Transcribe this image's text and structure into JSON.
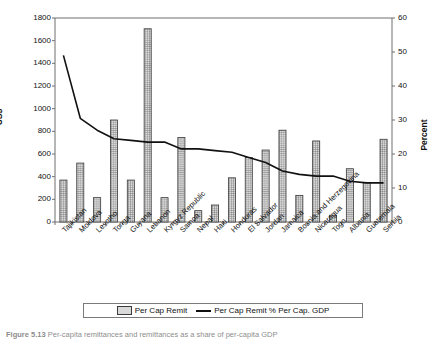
{
  "chart_data": {
    "type": "bar",
    "title": "",
    "subtitle": "",
    "xlabel": "",
    "ylabel": "US$",
    "y2label": "Percent",
    "ylim": [
      0,
      1800
    ],
    "y2lim": [
      0,
      60
    ],
    "yticks": [
      0,
      200,
      400,
      600,
      800,
      1000,
      1200,
      1400,
      1600,
      1800
    ],
    "y2ticks": [
      0,
      10,
      20,
      30,
      40,
      50,
      60
    ],
    "grid": false,
    "legend_position": "bottom",
    "categories": [
      "Tajikistan",
      "Moldova",
      "Lesotho",
      "Tonga",
      "Guyana",
      "Lebanon",
      "Kyrgyz Republic",
      "Samoa",
      "Nepal",
      "Haiti",
      "Honduras",
      "El Salvador",
      "Jordan",
      "Jamaica",
      "Bosnia and Herzegovina",
      "Nicaragua",
      "Togo",
      "Albania",
      "Guatemala",
      "Serbia"
    ],
    "series": [
      {
        "name": "Per Cap Remit",
        "type": "bar",
        "axis": "left",
        "unit": "US$",
        "values": [
          370,
          520,
          215,
          900,
          370,
          1705,
          215,
          745,
          100,
          150,
          390,
          570,
          635,
          810,
          235,
          715,
          60,
          470,
          345,
          730
        ]
      },
      {
        "name": "Per Cap Remit % Per Cap. GDP",
        "type": "line",
        "axis": "right",
        "unit": "Percent",
        "values": [
          49.0,
          30.5,
          27.0,
          24.5,
          24.0,
          23.5,
          23.5,
          21.5,
          21.5,
          21.0,
          20.5,
          19.0,
          17.5,
          15.0,
          14.0,
          13.5,
          13.5,
          12.0,
          11.5,
          11.5
        ]
      }
    ]
  },
  "legend": {
    "items": [
      {
        "label": "Per Cap Remit",
        "marker": "bar-swatch"
      },
      {
        "label": "Per Cap Remit % Per Cap. GDP",
        "marker": "line-swatch"
      }
    ]
  },
  "caption": {
    "figure_number": "Figure 5.13",
    "text": "Per-capita remittances and remittances as a share of per-capita GDP"
  },
  "colors": {
    "line": "#111111",
    "bar_fill": "#d9d9d9",
    "bar_edge": "#3a3a3a",
    "axis": "#6f6f6f",
    "text": "#111111"
  }
}
